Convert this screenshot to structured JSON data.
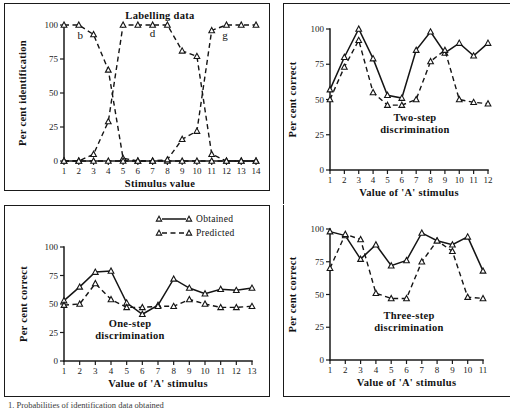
{
  "figure": {
    "caption_fragment": "1. Probabilities of identification data obtained"
  },
  "legend": {
    "obtained_label": "Obtained",
    "predicted_label": "Predicted"
  },
  "chart_data": [
    {
      "id": "labelling",
      "type": "line",
      "title": "Labelling data",
      "xlabel": "Stimulus value",
      "ylabel": "Per cent identification",
      "xlim": [
        1,
        14
      ],
      "ylim": [
        0,
        100
      ],
      "xticks": [
        1,
        2,
        3,
        4,
        5,
        6,
        7,
        8,
        9,
        10,
        11,
        12,
        13,
        14
      ],
      "yticks": [
        0,
        25,
        50,
        75,
        100
      ],
      "grid": false,
      "legend_position": "none",
      "annotations": [
        {
          "text": "b",
          "x": 2.1,
          "y": 90
        },
        {
          "text": "d",
          "x": 7.0,
          "y": 91
        },
        {
          "text": "g",
          "x": 11.9,
          "y": 90
        }
      ],
      "series": [
        {
          "name": "b",
          "style": "dashed",
          "x": [
            1,
            2,
            3,
            4,
            5,
            6,
            7,
            8,
            9,
            10,
            11,
            12,
            13,
            14
          ],
          "values": [
            100,
            100,
            93,
            67,
            2,
            0,
            0,
            0,
            0,
            0,
            0,
            0,
            0,
            0
          ]
        },
        {
          "name": "d",
          "style": "dashed",
          "x": [
            1,
            2,
            3,
            4,
            5,
            6,
            7,
            8,
            9,
            10,
            11,
            12,
            13,
            14
          ],
          "values": [
            0,
            0,
            5,
            29,
            100,
            100,
            100,
            100,
            81,
            77,
            5,
            0,
            0,
            0
          ]
        },
        {
          "name": "g",
          "style": "dashed",
          "x": [
            1,
            2,
            3,
            4,
            5,
            6,
            7,
            8,
            9,
            10,
            11,
            12,
            13,
            14
          ],
          "values": [
            0,
            0,
            0,
            0,
            0,
            0,
            0,
            1,
            16,
            22,
            96,
            100,
            100,
            100
          ]
        }
      ]
    },
    {
      "id": "two-step",
      "type": "line",
      "title": "Two-step\ndiscrimination",
      "title_line1": "Two-step",
      "title_line2": "discrimination",
      "xlabel": "Value of 'A' stimulus",
      "ylabel": "Per cent correct",
      "xlim": [
        1,
        12
      ],
      "ylim": [
        0,
        100
      ],
      "xticks": [
        1,
        2,
        3,
        4,
        5,
        6,
        7,
        8,
        9,
        10,
        11,
        12
      ],
      "yticks": [
        0,
        25,
        50,
        75,
        100
      ],
      "grid": false,
      "legend_position": "none",
      "categories": [
        1,
        2,
        3,
        4,
        5,
        6,
        7,
        8,
        9,
        10,
        11,
        12
      ],
      "series": [
        {
          "name": "Obtained",
          "style": "solid",
          "values": [
            57,
            80,
            100,
            79,
            53,
            51,
            85,
            98,
            83,
            90,
            81,
            90
          ]
        },
        {
          "name": "Predicted",
          "style": "dashed",
          "values": [
            50,
            73,
            92,
            55,
            46,
            46,
            50,
            77,
            85,
            50,
            48,
            47
          ]
        }
      ]
    },
    {
      "id": "one-step",
      "type": "line",
      "title": "One-step\ndiscrimination",
      "title_line1": "One-step",
      "title_line2": "discrimination",
      "xlabel": "Value of 'A' stimulus",
      "ylabel": "Per cent correct",
      "xlim": [
        1,
        13
      ],
      "ylim": [
        0,
        100
      ],
      "xticks": [
        1,
        2,
        3,
        4,
        5,
        6,
        7,
        8,
        9,
        10,
        11,
        12,
        13
      ],
      "yticks": [
        0,
        25,
        50,
        75,
        100
      ],
      "grid": false,
      "legend_position": "top-right",
      "categories": [
        1,
        2,
        3,
        4,
        5,
        6,
        7,
        8,
        9,
        10,
        11,
        12,
        13
      ],
      "series": [
        {
          "name": "Obtained",
          "style": "solid",
          "values": [
            53,
            65,
            78,
            79,
            51,
            41,
            49,
            72,
            64,
            59,
            63,
            62,
            64
          ]
        },
        {
          "name": "Predicted",
          "style": "dashed",
          "values": [
            49,
            50,
            68,
            54,
            47,
            47,
            48,
            48,
            54,
            50,
            47,
            47,
            48
          ]
        }
      ]
    },
    {
      "id": "three-step",
      "type": "line",
      "title": "Three-step\ndiscrimination",
      "title_line1": "Three-step",
      "title_line2": "discrimination",
      "xlabel": "Value of 'A' stimulus",
      "ylabel": "Per cent correct",
      "xlim": [
        1,
        11
      ],
      "ylim": [
        0,
        100
      ],
      "xticks": [
        1,
        2,
        3,
        4,
        5,
        6,
        7,
        8,
        9,
        10,
        11
      ],
      "yticks": [
        0,
        25,
        50,
        75,
        100
      ],
      "grid": false,
      "legend_position": "none",
      "categories": [
        1,
        2,
        3,
        4,
        5,
        6,
        7,
        8,
        9,
        10,
        11
      ],
      "series": [
        {
          "name": "Obtained",
          "style": "solid",
          "values": [
            98,
            95,
            77,
            88,
            72,
            76,
            97,
            91,
            88,
            94,
            68
          ]
        },
        {
          "name": "Predicted",
          "style": "dashed",
          "values": [
            70,
            96,
            92,
            51,
            47,
            47,
            75,
            91,
            83,
            48,
            47
          ]
        }
      ]
    }
  ]
}
